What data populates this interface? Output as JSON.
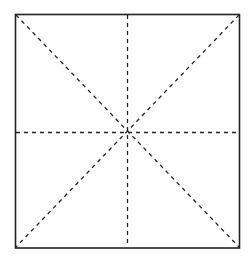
{
  "diagram": {
    "border_color": "#222222",
    "guide_color": "#222222",
    "background_color": "#ffffff",
    "guides": [
      "horizontal-midline",
      "vertical-midline",
      "diagonal-top-left-to-bottom-right",
      "diagonal-top-right-to-bottom-left"
    ]
  }
}
